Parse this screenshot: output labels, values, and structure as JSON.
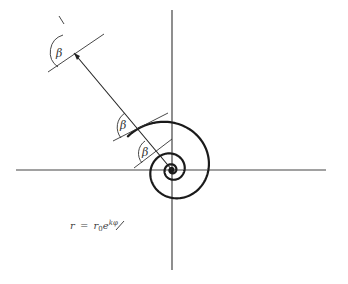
{
  "diagram": {
    "angle_symbol": "β",
    "angle_labels": [
      {
        "text": "β",
        "location": "outer turn"
      },
      {
        "text": "β",
        "location": "middle turn"
      },
      {
        "text": "β",
        "location": "inner turn"
      }
    ],
    "equation": {
      "lhs": "r",
      "equals": "=",
      "base": "r",
      "subscript": "0",
      "exp_base": "e",
      "exponent": "kφ",
      "full": "r = r0e^kφ"
    },
    "spiral": {
      "growth_per_turn": 2.9,
      "turns": 4.4
    },
    "colors": {
      "curve": "#1a1a1a",
      "axes": "#444444",
      "background": "#ffffff"
    }
  }
}
